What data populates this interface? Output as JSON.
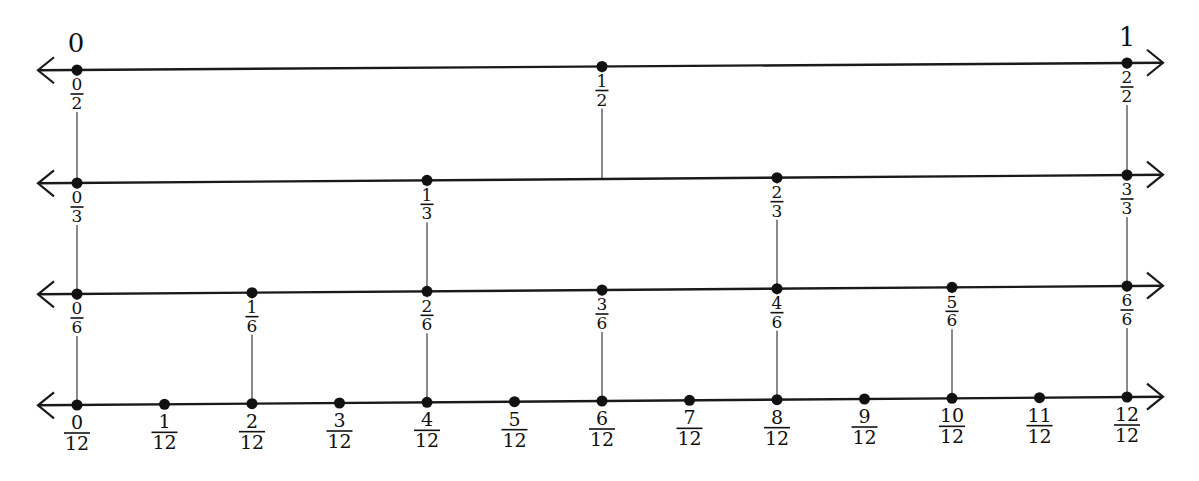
{
  "diagram": {
    "title": "",
    "end_labels": {
      "left": "0",
      "right": "1"
    },
    "colors": {
      "line": "#1a1a1a",
      "dot": "#111111",
      "connector": "#8a8a8a",
      "text": "#111111",
      "background": "#ffffff"
    },
    "layout": {
      "x_start": 77,
      "x_end": 1127,
      "arrow_left_x": 38,
      "arrow_right_x": 1163
    },
    "number_lines": [
      {
        "name": "halves",
        "denominator": 2,
        "y_left": 70,
        "y_right": 63,
        "labels": [
          "0/2",
          "1/2",
          "2/2"
        ]
      },
      {
        "name": "thirds",
        "denominator": 3,
        "y_left": 183,
        "y_right": 175,
        "labels": [
          "0/3",
          "1/3",
          "2/3",
          "3/3"
        ]
      },
      {
        "name": "sixths",
        "denominator": 6,
        "y_left": 294,
        "y_right": 286,
        "labels": [
          "0/6",
          "1/6",
          "2/6",
          "3/6",
          "4/6",
          "5/6",
          "6/6"
        ]
      },
      {
        "name": "twelfths",
        "denominator": 12,
        "y_left": 405,
        "y_right": 397,
        "labels": [
          "0/12",
          "1/12",
          "2/12",
          "3/12",
          "4/12",
          "5/12",
          "6/12",
          "7/12",
          "8/12",
          "9/12",
          "10/12",
          "11/12",
          "12/12"
        ]
      }
    ],
    "connectors_note": "Vertical gray lines link equivalent fractions across lines"
  }
}
